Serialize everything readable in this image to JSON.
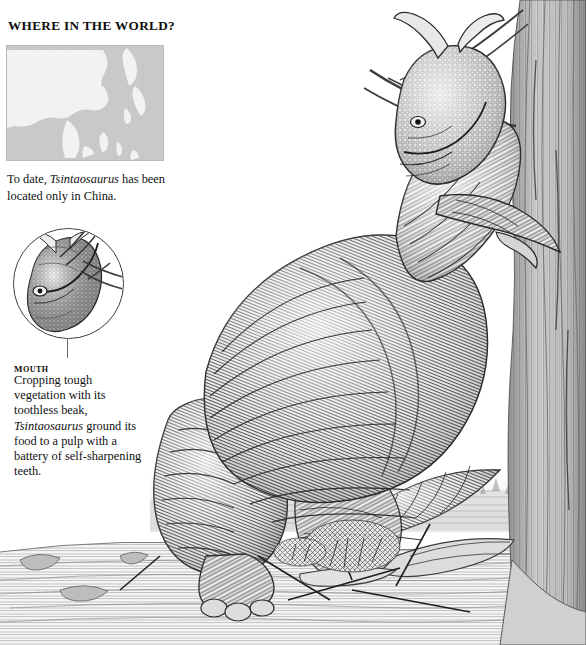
{
  "page": {
    "background_color": "#ffffff",
    "width": 586,
    "height": 645
  },
  "sidebar": {
    "heading": "WHERE IN THE WORLD?",
    "map": {
      "name": "east-asia-map",
      "region": "East Asia",
      "land_color": "#f2f2f2",
      "water_color": "#c9c9c9",
      "border_color": "#b9b9b9"
    },
    "map_caption": {
      "before": "To date, ",
      "species": "Tsintaosaurus",
      "after": " has been located only in China."
    },
    "detail_inset": {
      "label": "Mouth",
      "caption": {
        "before": "Cropping tough vegetation with its toothless beak, ",
        "species": "Tsintaosaurus",
        "after": " ground its food to a pulp with a battery of self-sharpening teeth."
      }
    }
  },
  "illustration": {
    "subject": "Tsintaosaurus",
    "description": "Pen-and-ink hadrosaur browsing on tree branches",
    "ink_color": "#2b2b2b",
    "elements": [
      "crested-head",
      "scaly-neck",
      "muscular-torso",
      "forelimbs-grasping-branch",
      "hind-legs",
      "tail",
      "tree-trunk",
      "fallen-logs",
      "scrub-brush",
      "ground-plane",
      "distant-horizon"
    ]
  }
}
